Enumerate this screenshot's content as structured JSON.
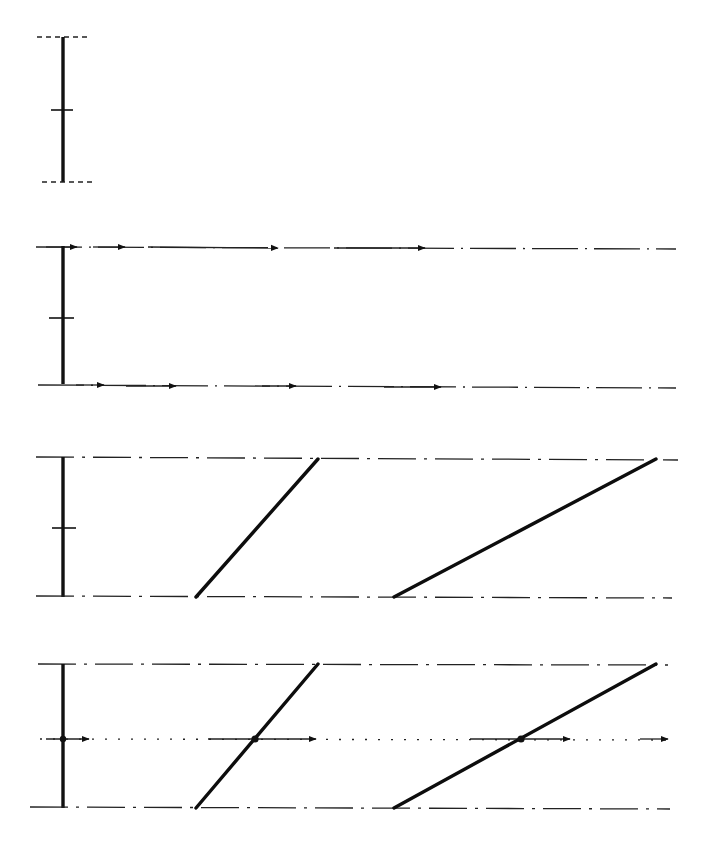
{
  "diagram": {
    "type": "technical-line-drawing",
    "colors": {
      "ink": "#111111",
      "background": "#ffffff"
    },
    "panels": [
      {
        "id": "panel-1",
        "elements": [
          "vertical-bar",
          "midpoint-tick",
          "top-cap-dashed",
          "bottom-cap-dashed"
        ],
        "bar": {
          "x": 63,
          "y_top": 37,
          "y_bottom": 182
        },
        "labels": []
      },
      {
        "id": "panel-2",
        "elements": [
          "vertical-bar",
          "midpoint-tick",
          "top-dashdot-line-with-arrows",
          "bottom-dashdot-line-with-arrows"
        ],
        "bar": {
          "x": 63,
          "y_top": 246,
          "y_bottom": 384
        },
        "top_line_arrows_x": [
          77,
          125,
          278,
          425
        ],
        "bottom_line_arrows_x": [
          104,
          176,
          296,
          441
        ],
        "labels": []
      },
      {
        "id": "panel-3",
        "elements": [
          "vertical-bar",
          "midpoint-tick",
          "top-dashdot-line",
          "bottom-dashdot-line",
          "slanted-line-1",
          "slanted-line-2"
        ],
        "bar": {
          "x": 63,
          "y_top": 457,
          "y_bottom": 597
        },
        "slants": [
          {
            "x1": 196,
            "y1": 597,
            "x2": 318,
            "y2": 459
          },
          {
            "x1": 394,
            "y1": 597,
            "x2": 656,
            "y2": 459
          }
        ],
        "labels": []
      },
      {
        "id": "panel-4",
        "elements": [
          "vertical-bar",
          "top-dashdot-line",
          "bottom-dashdot-line",
          "middle-dotted-line-with-arrows",
          "slanted-line-1",
          "slanted-line-2",
          "intersection-dots"
        ],
        "bar": {
          "x": 63,
          "y_top": 664,
          "y_bottom": 808
        },
        "middle_line_y": 739,
        "middle_arrows_x": [
          89,
          316,
          570,
          668
        ],
        "intersections": [
          {
            "x": 63,
            "y": 739
          },
          {
            "x": 255,
            "y": 739
          },
          {
            "x": 521,
            "y": 739
          }
        ],
        "slants": [
          {
            "x1": 196,
            "y1": 808,
            "x2": 318,
            "y2": 664
          },
          {
            "x1": 394,
            "y1": 808,
            "x2": 656,
            "y2": 664
          }
        ],
        "labels": []
      }
    ]
  }
}
